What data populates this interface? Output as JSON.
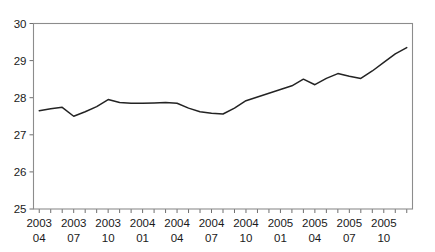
{
  "chart_data": {
    "type": "line",
    "title": "",
    "subtitle": "",
    "xlabel": "",
    "ylabel": "",
    "ylim": [
      25,
      30
    ],
    "ytick_values": [
      25,
      26,
      27,
      28,
      29,
      30
    ],
    "ytick_labels": [
      "25",
      "26",
      "27",
      "28",
      "29",
      "30"
    ],
    "grid": false,
    "legend": false,
    "legend_position": "none",
    "x_tick_label_style": "two-line year over month",
    "xtick_labels": [
      {
        "year": "2003",
        "month": "04"
      },
      {
        "year": "2003",
        "month": "07"
      },
      {
        "year": "2003",
        "month": "10"
      },
      {
        "year": "2004",
        "month": "01"
      },
      {
        "year": "2004",
        "month": "04"
      },
      {
        "year": "2004",
        "month": "07"
      },
      {
        "year": "2004",
        "month": "10"
      },
      {
        "year": "2005",
        "month": "01"
      },
      {
        "year": "2005",
        "month": "04"
      },
      {
        "year": "2005",
        "month": "07"
      },
      {
        "year": "2005",
        "month": "10"
      }
    ],
    "x": [
      "2003-04",
      "2003-05",
      "2003-06",
      "2003-07",
      "2003-08",
      "2003-09",
      "2003-10",
      "2003-11",
      "2003-12",
      "2004-01",
      "2004-02",
      "2004-03",
      "2004-04",
      "2004-05",
      "2004-06",
      "2004-07",
      "2004-08",
      "2004-09",
      "2004-10",
      "2004-11",
      "2004-12",
      "2005-01",
      "2005-02",
      "2005-03",
      "2005-04",
      "2005-05",
      "2005-06",
      "2005-07",
      "2005-08",
      "2005-09",
      "2005-10",
      "2005-11",
      "2005-12"
    ],
    "series": [
      {
        "name": "series-1",
        "color": "#232323",
        "values": [
          27.65,
          27.7,
          27.74,
          27.5,
          27.62,
          27.76,
          27.95,
          27.87,
          27.85,
          27.85,
          27.86,
          27.87,
          27.85,
          27.72,
          27.62,
          27.58,
          27.56,
          27.72,
          27.92,
          28.02,
          28.12,
          28.22,
          28.32,
          28.5,
          28.35,
          28.52,
          28.65,
          28.58,
          28.52,
          28.72,
          28.95,
          29.18,
          29.35
        ]
      }
    ],
    "axis_color": "#8c8c8c",
    "tick_color": "#6f6f6f",
    "text_color": "#1a1a1a",
    "background": "#ffffff"
  }
}
